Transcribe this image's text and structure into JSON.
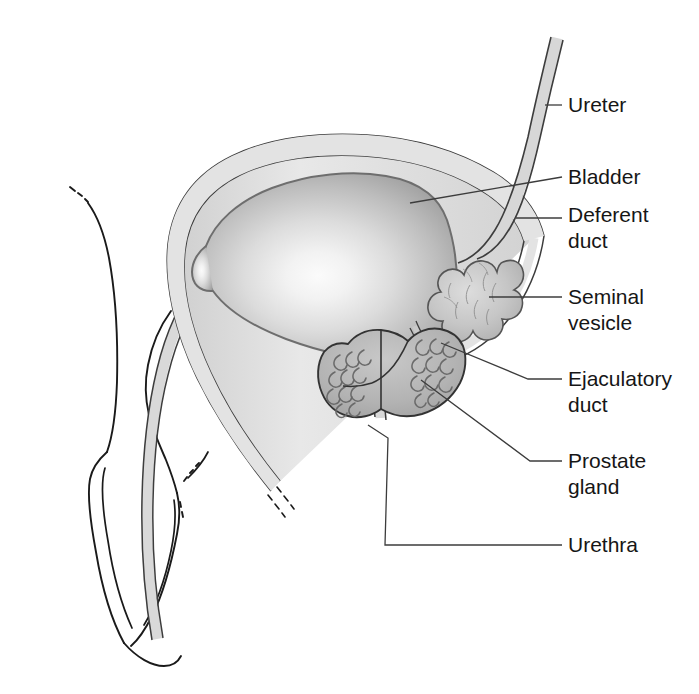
{
  "figure": {
    "background_color": "#ffffff",
    "width": 699,
    "height": 694
  },
  "style": {
    "outline_color": "#1a1a1a",
    "leader_color": "#3c3c3c",
    "text_color": "#161616",
    "tube_fill": "#dcdcdc",
    "tube_stroke": "#4a4a4a",
    "bladder_edge_color": "#8a8a8a",
    "bladder_center_color": "#f7f7f7",
    "prostate_fill": "#b4b4b4",
    "prostate_stroke": "#3a3a3a",
    "vesicle_fill": "#c4c4c4",
    "vesicle_stroke": "#555555"
  },
  "labels": [
    {
      "id": "ureter",
      "text": "Ureter",
      "text2": "",
      "x": 568,
      "y": 112
    },
    {
      "id": "bladder",
      "text": "Bladder",
      "text2": "",
      "x": 568,
      "y": 184
    },
    {
      "id": "deferent-duct",
      "text": "Deferent",
      "text2": "duct",
      "x": 568,
      "y": 222
    },
    {
      "id": "seminal-vesicle",
      "text": "Seminal",
      "text2": "vesicle",
      "x": 568,
      "y": 304
    },
    {
      "id": "ejaculatory-duct",
      "text": "Ejaculatory",
      "text2": "duct",
      "x": 568,
      "y": 386
    },
    {
      "id": "prostate-gland",
      "text": "Prostate",
      "text2": "gland",
      "x": 568,
      "y": 468
    },
    {
      "id": "urethra",
      "text": "Urethra",
      "text2": "",
      "x": 568,
      "y": 550
    }
  ],
  "leaders": [
    {
      "id": "ureter-leader",
      "points": "545,105 562,105"
    },
    {
      "id": "bladder-leader",
      "points": "410,203 562,177"
    },
    {
      "id": "deferent-duct-leader",
      "points": "516,218 562,218"
    },
    {
      "id": "seminal-vesicle-leader",
      "points": "489,297 562,297"
    },
    {
      "id": "ejaculatory-duct-leader",
      "points": "441,343 528,379 562,379"
    },
    {
      "id": "prostate-leader",
      "points": "421,380 530,461 562,461"
    },
    {
      "id": "urethra-leader",
      "points": "368,425 388,438 385,545 562,545"
    }
  ],
  "parts": {
    "ureter": "Ureter",
    "bladder": "Bladder",
    "deferent_duct": "Deferent duct",
    "seminal_vesicle": "Seminal vesicle",
    "ejaculatory_duct": "Ejaculatory duct",
    "prostate_gland": "Prostate gland",
    "urethra": "Urethra",
    "penis": "Penis",
    "glans": "Glans"
  }
}
